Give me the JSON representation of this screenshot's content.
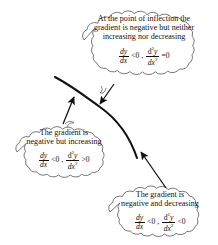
{
  "figure": {
    "name": "gradient-second-derivative-annotated-curve",
    "background_color": "#ffffff",
    "ink_color": "#111111",
    "curve": {
      "name": "decreasing-curve-with-inflection",
      "description": "Descending S-shaped curve with a point of inflection near its middle",
      "stroke_width": 2.0
    }
  },
  "clouds": [
    {
      "id": "cloud-top",
      "lines": [
        "At the point of inflection the",
        "gradient is negative but neither",
        "increasing nor decreasing"
      ],
      "formula": {
        "first_derivative": "dy/dx",
        "first_relation": "<0",
        "separator": ",",
        "second_derivative": "d2y/dx2",
        "second_relation": "=0",
        "numerator_1": "dy",
        "denominator_1": "dx",
        "numerator_2": "d",
        "numerator_2_sup": "2",
        "numerator_2_var": "y",
        "denominator_2": "dx",
        "denominator_2_sup": "2"
      }
    },
    {
      "id": "cloud-left",
      "lines": [
        "The gradient is",
        "negative but increasing"
      ],
      "formula": {
        "first_derivative": "dy/dx",
        "first_relation": "<0",
        "separator": ",",
        "second_derivative": "d2y/dx2",
        "second_relation": ">0",
        "numerator_1": "dy",
        "denominator_1": "dx",
        "numerator_2": "d",
        "numerator_2_sup": "2",
        "numerator_2_var": "y",
        "denominator_2": "dx",
        "denominator_2_sup": "2"
      }
    },
    {
      "id": "cloud-bottom",
      "lines": [
        "The gradient is",
        "negative and decreasing"
      ],
      "formula": {
        "first_derivative": "dy/dx",
        "first_relation": "<0",
        "separator": ",",
        "second_derivative": "d2y/dx2",
        "second_relation": "<0",
        "numerator_1": "dy",
        "denominator_1": "dx",
        "numerator_2": "d",
        "numerator_2_sup": "2",
        "numerator_2_var": "y",
        "denominator_2": "dx",
        "denominator_2_sup": "2"
      }
    }
  ],
  "arrows": [
    {
      "id": "arrow-top",
      "from": "cloud-top",
      "to": "curve-inflection-point",
      "direction": "down-left"
    },
    {
      "id": "arrow-left",
      "from": "cloud-left",
      "to": "curve-upper-segment",
      "direction": "up-right"
    },
    {
      "id": "arrow-bottom",
      "from": "cloud-bottom",
      "to": "curve-lower-segment",
      "direction": "up-left"
    }
  ]
}
